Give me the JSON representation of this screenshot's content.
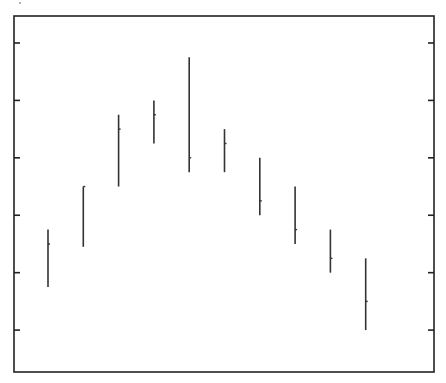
{
  "chart_data": {
    "type": "high-low-close",
    "title": "",
    "xlabel": "",
    "ylabel": "",
    "x_tick_labels": [],
    "y_tick_labels": [],
    "grid": false,
    "legend": null,
    "ylim": [
      0.27,
      6.47
    ],
    "y_ticks": [
      1,
      2,
      3,
      4,
      5,
      6
    ],
    "y_ticks_on_both_sides": true,
    "categories": [
      1,
      2,
      3,
      4,
      5,
      6,
      7,
      8,
      9,
      10
    ],
    "series": [
      {
        "name": "high",
        "values": [
          2.75,
          3.5,
          4.75,
          5.0,
          5.75,
          4.5,
          4.0,
          3.5,
          2.75,
          2.25
        ]
      },
      {
        "name": "low",
        "values": [
          1.75,
          2.45,
          3.5,
          4.25,
          3.75,
          3.75,
          3.0,
          2.5,
          2.0,
          1.0
        ]
      },
      {
        "name": "close",
        "values": [
          2.5,
          3.5,
          4.5,
          4.75,
          4.0,
          4.25,
          3.25,
          2.75,
          2.25,
          1.5
        ]
      }
    ],
    "colors": {
      "line": "#333333",
      "axis": "#222222",
      "background": "#ffffff"
    }
  }
}
